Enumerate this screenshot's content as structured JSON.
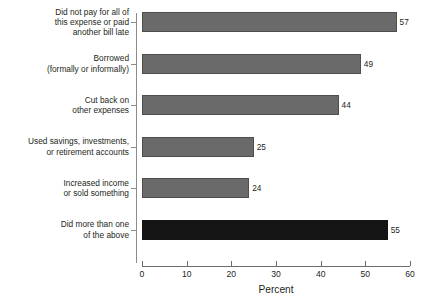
{
  "chart_data": {
    "type": "bar",
    "orientation": "horizontal",
    "title": "",
    "subtitle": "",
    "xlabel": "Percent",
    "ylabel": "",
    "xlim": [
      0,
      60
    ],
    "xticks": [
      0,
      10,
      20,
      30,
      40,
      50,
      60
    ],
    "xtick_labels": [
      "0",
      "10",
      "20",
      "30",
      "40",
      "50",
      "60"
    ],
    "grid": false,
    "legend": null,
    "categories": [
      "Did not pay for all of\nthis expense or paid\nanother bill late",
      "Borrowed\n(formally or informally)",
      "Cut back on\nother expenses",
      "Used savings, investments,\nor retirement accounts",
      "Increased income\nor sold something",
      "Did more than one\nof the above"
    ],
    "values": [
      57,
      49,
      44,
      25,
      24,
      55
    ],
    "value_labels": [
      "57",
      "49",
      "44",
      "25",
      "24",
      "55"
    ],
    "bar_colors": [
      "#6a6a6a",
      "#6a6a6a",
      "#6a6a6a",
      "#6a6a6a",
      "#6a6a6a",
      "#141414"
    ],
    "colors": {
      "bar_gray": "#6a6a6a",
      "bar_dark": "#141414",
      "axis": "#6d6d6d",
      "text": "#231f20",
      "background": "#ffffff"
    }
  }
}
